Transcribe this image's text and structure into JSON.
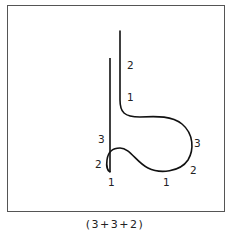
{
  "figure": {
    "caption": "(3+3+2)",
    "stroke_color": "#111111",
    "frame_color": "#555555",
    "labels": [
      {
        "id": "upper-2",
        "text": "2",
        "x": 127,
        "y": 60
      },
      {
        "id": "upper-1",
        "text": "1",
        "x": 127,
        "y": 92
      },
      {
        "id": "left-3",
        "text": "3",
        "x": 98,
        "y": 134
      },
      {
        "id": "left-2",
        "text": "2",
        "x": 95,
        "y": 159
      },
      {
        "id": "bottom-left-1",
        "text": "1",
        "x": 108,
        "y": 177
      },
      {
        "id": "right-3",
        "text": "3",
        "x": 194,
        "y": 138
      },
      {
        "id": "right-2",
        "text": "2",
        "x": 190,
        "y": 165
      },
      {
        "id": "bottom-right-1",
        "text": "1",
        "x": 163,
        "y": 177
      }
    ]
  }
}
